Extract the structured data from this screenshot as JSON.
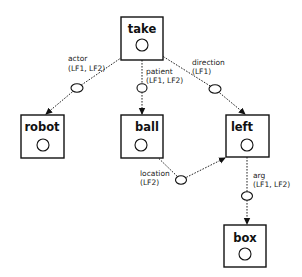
{
  "diagram": {
    "type": "semantic-graph",
    "nodes": [
      {
        "id": "take",
        "label": "take"
      },
      {
        "id": "robot",
        "label": "robot"
      },
      {
        "id": "ball",
        "label": "ball"
      },
      {
        "id": "left",
        "label": "left"
      },
      {
        "id": "box",
        "label": "box"
      }
    ],
    "edges": [
      {
        "from": "take",
        "to": "robot",
        "role": "actor",
        "forms": "(LF1, LF2)"
      },
      {
        "from": "take",
        "to": "ball",
        "role": "patient",
        "forms": "(LF1, LF2)"
      },
      {
        "from": "take",
        "to": "left",
        "role": "direction",
        "forms": "(LF1)"
      },
      {
        "from": "ball",
        "to": "left",
        "role": "location",
        "forms": "(LF2)"
      },
      {
        "from": "left",
        "to": "box",
        "role": "arg",
        "forms": "(LF1, LF2)"
      }
    ]
  }
}
